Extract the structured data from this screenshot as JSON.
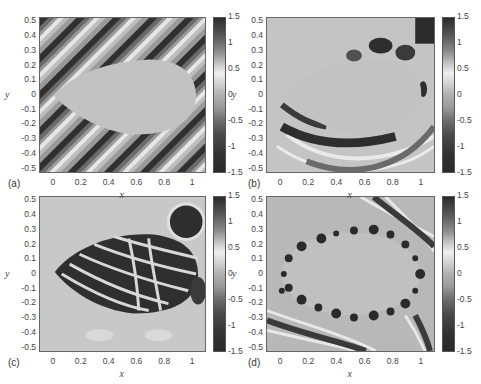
{
  "figure": {
    "panels": [
      {
        "id": "a",
        "label": "(a)",
        "xlabel": "x",
        "ylabel": "y"
      },
      {
        "id": "b",
        "label": "(b)",
        "xlabel": "x",
        "ylabel": "y"
      },
      {
        "id": "c",
        "label": "(c)",
        "xlabel": "x",
        "ylabel": "y"
      },
      {
        "id": "d",
        "label": "(d)",
        "xlabel": "x",
        "ylabel": "y"
      }
    ],
    "x_ticks": [
      "0",
      "0.2",
      "0.4",
      "0.6",
      "0.8",
      "1"
    ],
    "y_ticks": [
      "0.5",
      "0.4",
      "0.3",
      "0.2",
      "0.1",
      "0",
      "-0.1",
      "-0.2",
      "-0.3",
      "-0.4",
      "-0.5"
    ],
    "colorbar_ticks": [
      "1.5",
      "1",
      "0.5",
      "0",
      "-0.5",
      "-1",
      "-1.5"
    ]
  },
  "chart_data": [
    {
      "type": "heatmap",
      "title": "(a) incident plane wave field around leaf-shaped obstacle",
      "xlabel": "x",
      "ylabel": "y",
      "xlim": [
        -0.1,
        1.1
      ],
      "ylim": [
        -0.53,
        0.53
      ],
      "colorbar_range": [
        -1.5,
        1.5
      ],
      "colorbar_ticks": [
        1.5,
        1,
        0.5,
        0,
        -0.5,
        -1,
        -1.5
      ]
    },
    {
      "type": "heatmap",
      "title": "(b) scattered field around obstacle",
      "xlabel": "x",
      "ylabel": "y",
      "xlim": [
        -0.1,
        1.1
      ],
      "ylim": [
        -0.53,
        0.53
      ],
      "colorbar_range": [
        -1.5,
        1.5
      ],
      "colorbar_ticks": [
        1.5,
        1,
        0.5,
        0,
        -0.5,
        -1,
        -1.5
      ]
    },
    {
      "type": "heatmap",
      "title": "(c) interior field",
      "xlabel": "x",
      "ylabel": "y",
      "xlim": [
        -0.1,
        1.1
      ],
      "ylim": [
        -0.53,
        0.53
      ],
      "colorbar_range": [
        -1.5,
        1.5
      ],
      "colorbar_ticks": [
        1.5,
        1,
        0.5,
        0,
        -0.5,
        -1,
        -1.5
      ]
    },
    {
      "type": "heatmap",
      "title": "(d) field around elliptical obstacle with boundary resonances",
      "xlabel": "x",
      "ylabel": "y",
      "xlim": [
        -0.1,
        1.1
      ],
      "ylim": [
        -0.53,
        0.53
      ],
      "colorbar_range": [
        -1.5,
        1.5
      ],
      "colorbar_ticks": [
        1.5,
        1,
        0.5,
        0,
        -0.5,
        -1,
        -1.5
      ]
    }
  ]
}
